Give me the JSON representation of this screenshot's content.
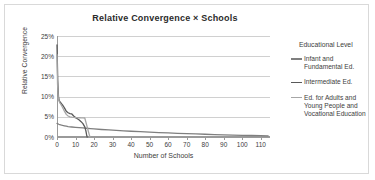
{
  "chart_data": {
    "type": "line",
    "title": "Relative Convergence  ×  Schools",
    "xlabel": "Number of Schools",
    "ylabel": "Relative Convergence",
    "xlim": [
      0,
      115
    ],
    "ylim": [
      0,
      0.25
    ],
    "grid": "horizontal",
    "legend_position": "right",
    "legend_title": "Educational Level",
    "y_tick_labels": [
      "25%",
      "20%",
      "15%",
      "10%",
      "5%",
      "0%"
    ],
    "y_tick_values": [
      0.25,
      0.2,
      0.15,
      0.1,
      0.05,
      0.0
    ],
    "x_tick_labels": [
      "0",
      "10",
      "20",
      "30",
      "40",
      "50",
      "60",
      "70",
      "80",
      "90",
      "100",
      "110"
    ],
    "x_tick_values": [
      0,
      10,
      20,
      30,
      40,
      50,
      60,
      70,
      80,
      90,
      100,
      110
    ],
    "series": [
      {
        "name": "Infant and Fundamental Ed.",
        "color": "#7f7f7f",
        "points": [
          [
            0,
            0.0335
          ],
          [
            1,
            0.0315
          ],
          [
            2,
            0.03
          ],
          [
            3,
            0.0288
          ],
          [
            4,
            0.0278
          ],
          [
            5,
            0.0268
          ],
          [
            6,
            0.0258
          ],
          [
            8,
            0.0248
          ],
          [
            10,
            0.024
          ],
          [
            12,
            0.0232
          ],
          [
            14,
            0.0224
          ],
          [
            16,
            0.0216
          ],
          [
            18,
            0.0208
          ],
          [
            20,
            0.02
          ],
          [
            24,
            0.0186
          ],
          [
            28,
            0.0174
          ],
          [
            32,
            0.0163
          ],
          [
            36,
            0.0152
          ],
          [
            40,
            0.0142
          ],
          [
            45,
            0.0131
          ],
          [
            50,
            0.012
          ],
          [
            55,
            0.011
          ],
          [
            60,
            0.0101
          ],
          [
            65,
            0.0092
          ],
          [
            70,
            0.0084
          ],
          [
            75,
            0.0076
          ],
          [
            80,
            0.0068
          ],
          [
            85,
            0.0061
          ],
          [
            90,
            0.0054
          ],
          [
            95,
            0.0048
          ],
          [
            100,
            0.0042
          ],
          [
            105,
            0.0037
          ],
          [
            110,
            0.0032
          ],
          [
            114,
            0.0029
          ]
        ]
      },
      {
        "name": "Intermediate Ed.",
        "color": "#595959",
        "points": [
          [
            0,
            0.228
          ],
          [
            0.4,
            0.14
          ],
          [
            0.8,
            0.1
          ],
          [
            1.2,
            0.09
          ],
          [
            1.8,
            0.086
          ],
          [
            2.5,
            0.082
          ],
          [
            3.2,
            0.078
          ],
          [
            4,
            0.072
          ],
          [
            5,
            0.064
          ],
          [
            6,
            0.06
          ],
          [
            7,
            0.058
          ],
          [
            8,
            0.057
          ],
          [
            9,
            0.052
          ],
          [
            10,
            0.048
          ],
          [
            11,
            0.045
          ],
          [
            12,
            0.042
          ],
          [
            13,
            0.038
          ],
          [
            14,
            0.033
          ],
          [
            15,
            0.025
          ],
          [
            15.6,
            0.015
          ],
          [
            16,
            0.005
          ],
          [
            16.3,
            0.0
          ]
        ]
      },
      {
        "name": "Ed. for Adults and Young People and Vocational Education",
        "color": "#a6a6a6",
        "points": [
          [
            0,
            0.204
          ],
          [
            0.3,
            0.13
          ],
          [
            0.7,
            0.098
          ],
          [
            1.1,
            0.089
          ],
          [
            1.6,
            0.084
          ],
          [
            2.2,
            0.08
          ],
          [
            3,
            0.073
          ],
          [
            4,
            0.064
          ],
          [
            5,
            0.056
          ],
          [
            6,
            0.052
          ],
          [
            7,
            0.05
          ],
          [
            8,
            0.049
          ],
          [
            9,
            0.0485
          ],
          [
            10,
            0.048
          ],
          [
            11,
            0.0478
          ],
          [
            12,
            0.0476
          ],
          [
            13,
            0.0474
          ],
          [
            14,
            0.0472
          ],
          [
            15,
            0.047
          ],
          [
            16,
            0.03
          ],
          [
            16.8,
            0.016
          ],
          [
            17.4,
            0.006
          ],
          [
            17.8,
            0.0
          ]
        ]
      }
    ]
  },
  "legend": {
    "title": "Educational Level",
    "items": [
      {
        "label": "Infant and Fundamental Ed.",
        "color": "#7f7f7f"
      },
      {
        "label": "Intermediate Ed.",
        "color": "#595959"
      },
      {
        "label": "Ed. for Adults and Young People and Vocational Education",
        "color": "#a6a6a6"
      }
    ]
  }
}
